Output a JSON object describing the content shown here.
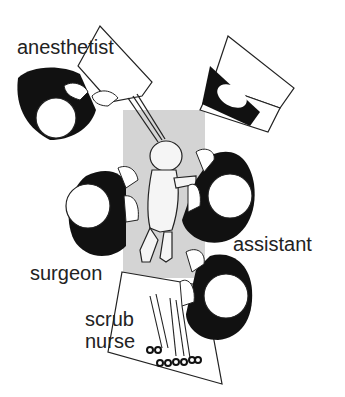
{
  "diagram": {
    "type": "operating room layout (top view)",
    "labels": {
      "anesthetist": "anesthetist",
      "assistant": "assistant",
      "surgeon": "surgeon",
      "scrub_nurse_line1": "scrub",
      "scrub_nurse_line2": "nurse"
    },
    "elements": [
      {
        "id": "operating-table",
        "desc": "gray patient table with infant"
      },
      {
        "id": "anesthesia-table",
        "desc": "anesthetist work surface with tubes to patient"
      },
      {
        "id": "monitor",
        "desc": "overhead monitor/lamp"
      },
      {
        "id": "instrument-tray",
        "desc": "scrub nurse instrument tray with scissors/clamps"
      }
    ],
    "colors": {
      "table_gray": "#d3d3d3",
      "figure_black": "#111111",
      "outline": "#222222",
      "text": "#222222"
    }
  }
}
